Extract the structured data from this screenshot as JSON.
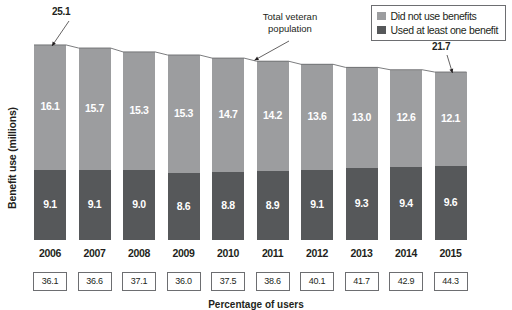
{
  "chart_data": {
    "type": "bar",
    "stacked": true,
    "title": "",
    "xlabel": "Percentage of users",
    "ylabel": "Benefit use (millions)",
    "categories": [
      "2006",
      "2007",
      "2008",
      "2009",
      "2010",
      "2011",
      "2012",
      "2013",
      "2014",
      "2015"
    ],
    "series": [
      {
        "name": "Used at least one benefit",
        "color": "#56585a",
        "values": [
          9.1,
          9.1,
          9.0,
          8.6,
          8.8,
          8.9,
          9.1,
          9.3,
          9.4,
          9.6
        ]
      },
      {
        "name": "Did not use benefits",
        "color": "#9c9d9f",
        "values": [
          16.1,
          15.7,
          15.3,
          15.3,
          14.7,
          14.2,
          13.6,
          13.0,
          12.6,
          12.1
        ]
      }
    ],
    "totals": [
      25.2,
      24.8,
      24.3,
      23.9,
      23.5,
      23.1,
      22.7,
      22.3,
      22.0,
      21.7
    ],
    "total_labels": {
      "first": "25.1",
      "last": "21.7"
    },
    "boxed_values": [
      "36.1",
      "36.6",
      "37.1",
      "36.0",
      "37.5",
      "38.6",
      "40.1",
      "41.7",
      "42.9",
      "44.3"
    ],
    "ylim": [
      0,
      27
    ],
    "grid": false,
    "legend_position": "top-right",
    "annotations": [
      {
        "text": "Total veteran population",
        "target": "trend-line"
      }
    ]
  },
  "annotation": {
    "total_population_line1": "Total veteran",
    "total_population_line2": "population"
  },
  "legend": {
    "items": [
      {
        "label": "Did not use benefits",
        "color": "#9c9d9f"
      },
      {
        "label": "Used at least one benefit",
        "color": "#56585a"
      }
    ]
  },
  "axis": {
    "y_title": "Benefit use (millions)",
    "x_caption": "Percentage of users"
  }
}
